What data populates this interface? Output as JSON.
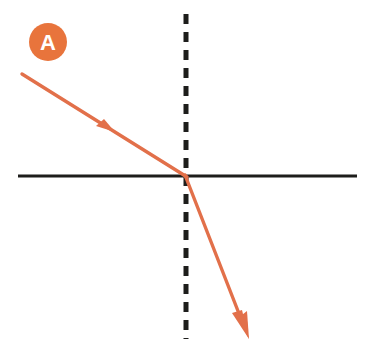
{
  "figure": {
    "kind": "physics-refraction-ray-diagram",
    "width": 369,
    "height": 345,
    "background_color": "#ffffff"
  },
  "label_badge": {
    "text": "A",
    "shape": "filled-circle",
    "fill_color": "#E8743C",
    "text_color": "#ffffff",
    "center_x": 48,
    "center_y": 42,
    "radius": 19
  },
  "boundary_line": {
    "name": "interface-surface",
    "style": "solid",
    "color": "#1d1d1b",
    "stroke_width": 3,
    "x1": 18,
    "y1": 176,
    "x2": 357,
    "y2": 176
  },
  "normal_line": {
    "name": "normal-dashed-line",
    "style": "dashed",
    "color": "#1d1d1b",
    "stroke_width": 5,
    "dash": "10 8",
    "x1": 186,
    "y1": 14,
    "x2": 186,
    "y2": 339
  },
  "incident_ray": {
    "name": "incident-ray",
    "color": "#E2704A",
    "stroke_width": 3.4,
    "x1": 22,
    "y1": 74,
    "x2": 186,
    "y2": 176,
    "arrow_at_x": 110,
    "arrow_at_y": 129,
    "arrow_direction": "down-right"
  },
  "refracted_ray": {
    "name": "refracted-ray",
    "color": "#E2704A",
    "stroke_width": 3.4,
    "x1": 186,
    "y1": 176,
    "x2": 248,
    "y2": 337,
    "arrow_at_x": 248,
    "arrow_at_y": 337,
    "arrow_direction": "down-right"
  },
  "intersection_point": {
    "name": "point-of-incidence",
    "x": 186,
    "y": 176
  }
}
